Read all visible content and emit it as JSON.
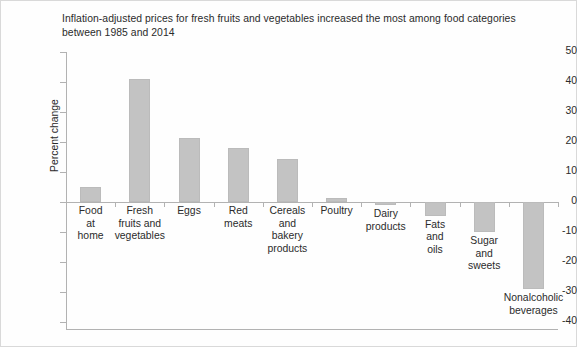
{
  "chart_data": {
    "type": "bar",
    "xlabel": "",
    "ylabel": "Percent change",
    "ylim": [
      -40,
      50
    ],
    "ytick_step": 10,
    "grid": false,
    "legend": null,
    "bar_color": "#c3c3c3",
    "categories": [
      "Food\nat\nhome",
      "Fresh\nfruits and\nvegetables",
      "Eggs",
      "Red\nmeats",
      "Cereals\nand\nbakery\nproducts",
      "Poultry",
      "Dairy\nproducts",
      "Fats\nand\noils",
      "Sugar\nand\nsweets",
      "Nonalcoholic\nbeverages"
    ],
    "values": [
      5,
      41,
      21.5,
      18,
      14.5,
      1.5,
      -1,
      -4.5,
      -10,
      -29
    ],
    "yticks": [
      "50",
      "40",
      "30",
      "20",
      "10",
      "0",
      "-10",
      "-20",
      "-30",
      "-40"
    ]
  },
  "title": {
    "line1": "Inflation-adjusted prices for fresh fruits and vegetables increased the most among food categories",
    "line2": "between 1985 and 2014"
  }
}
